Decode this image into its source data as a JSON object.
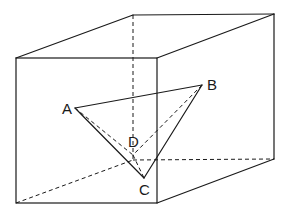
{
  "diagram": {
    "type": "geometry-3d",
    "colors": {
      "stroke": "#1a1a1a",
      "background": "#ffffff"
    },
    "points": {
      "A": {
        "label": "A",
        "x": 75,
        "y": 108
      },
      "B": {
        "label": "B",
        "x": 202,
        "y": 85
      },
      "C": {
        "label": "C",
        "x": 144,
        "y": 178
      },
      "D": {
        "label": "D",
        "x": 133,
        "y": 155
      }
    },
    "labels": {
      "A": "A",
      "B": "B",
      "C": "C",
      "D": "D"
    },
    "box": {
      "front_top_left": [
        16,
        58
      ],
      "front_top_right": [
        157,
        58
      ],
      "front_bottom_left": [
        16,
        203
      ],
      "front_bottom_right": [
        157,
        203
      ],
      "back_top_left": [
        133,
        15
      ],
      "back_top_right": [
        274,
        14
      ],
      "back_bottom_left": [
        133,
        160
      ],
      "back_bottom_right": [
        274,
        159
      ]
    },
    "visible_edges": [
      "AB",
      "AC",
      "BC"
    ],
    "hidden_edges": [
      "AD",
      "BD",
      "CD"
    ]
  }
}
